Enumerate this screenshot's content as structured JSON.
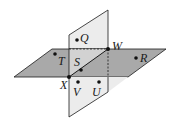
{
  "diagram": {
    "type": "intersecting-planes",
    "colors": {
      "horizontal_plane": "#a8a8a8",
      "vertical_plane": "#eaeaea",
      "stroke": "#1a1a1a"
    },
    "points": {
      "Q": "Q",
      "W": "W",
      "T": "T",
      "S": "S",
      "R": "R",
      "X": "X",
      "V": "V",
      "U": "U"
    }
  }
}
